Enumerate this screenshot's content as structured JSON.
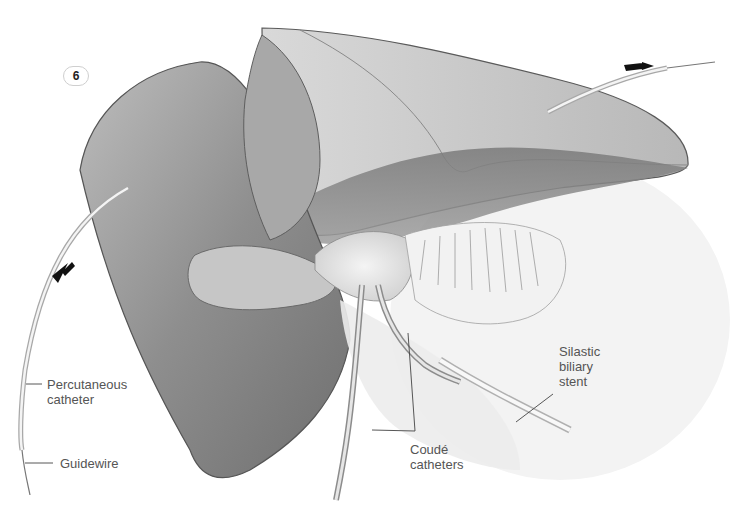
{
  "figure": {
    "number": "6",
    "type": "surgical illustration",
    "labels": {
      "percutaneous_catheter": [
        "Percutaneous",
        "catheter"
      ],
      "guidewire": "Guidewire",
      "coude_catheters": [
        "Coudé",
        "catheters"
      ],
      "silastic_biliary_stent": [
        "Silastic",
        "biliary",
        "stent"
      ]
    },
    "arrows": [
      {
        "name": "left-catheter-direction",
        "direction": "down-left"
      },
      {
        "name": "right-catheter-direction",
        "direction": "right"
      }
    ]
  },
  "colors": {
    "background": "#ffffff",
    "organ_light": "#c8c8c8",
    "organ_mid": "#9a9a9a",
    "organ_dark": "#6e6e6e",
    "label_text": "#555555",
    "leader_line": "#444444"
  }
}
